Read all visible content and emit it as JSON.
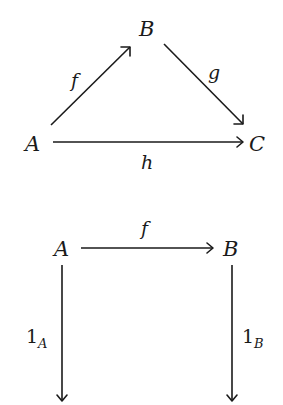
{
  "diagrams": [
    {
      "name": "commutative-triangle",
      "objects": {
        "A": "A",
        "B": "B",
        "C": "C"
      },
      "morphisms": [
        {
          "label": "f",
          "from": "A",
          "to": "B"
        },
        {
          "label": "g",
          "from": "B",
          "to": "C"
        },
        {
          "label": "h",
          "from": "A",
          "to": "C"
        }
      ]
    },
    {
      "name": "identity-square",
      "objects": {
        "A": "A",
        "B": "B"
      },
      "morphisms": [
        {
          "label": "f",
          "from": "A",
          "to": "B"
        },
        {
          "label_base": "1",
          "label_sub": "A",
          "from": "A",
          "to": "A"
        },
        {
          "label_base": "1",
          "label_sub": "B",
          "from": "B",
          "to": "B"
        }
      ]
    }
  ]
}
